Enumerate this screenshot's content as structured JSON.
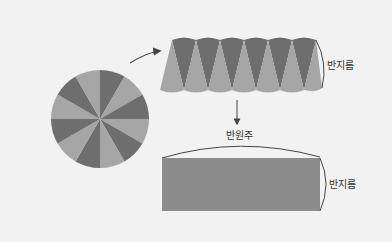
{
  "diagram": {
    "colors": {
      "background": "#f2f2f2",
      "dark_sector": "#6e6e6e",
      "light_sector": "#a6a6a6",
      "rectangle": "#8c8c8c",
      "line": "#444444"
    },
    "circle": {
      "sectors": 12,
      "label": ""
    },
    "strip": {
      "label_side": "반지름"
    },
    "rectangle": {
      "label_top": "반원주",
      "label_side": "반지름"
    }
  }
}
